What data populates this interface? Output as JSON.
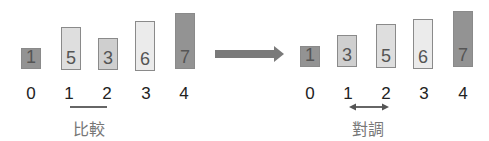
{
  "colors": {
    "dark": "#939393",
    "medium": "#cfcfcf",
    "light": "#dedede",
    "lightest": "#ebebeb",
    "border": "#8a8a8a",
    "arrow": "#7a7a7a",
    "caption": "#777777"
  },
  "before": {
    "bars": [
      {
        "value": "1",
        "index": "0",
        "fill": "#939393"
      },
      {
        "value": "5",
        "index": "1",
        "fill": "#dedede"
      },
      {
        "value": "3",
        "index": "2",
        "fill": "#cfcfcf"
      },
      {
        "value": "6",
        "index": "3",
        "fill": "#ebebeb"
      },
      {
        "value": "7",
        "index": "4",
        "fill": "#939393"
      }
    ],
    "caption": "比較",
    "marker": "line-under-1-2"
  },
  "after": {
    "bars": [
      {
        "value": "1",
        "index": "0",
        "fill": "#939393"
      },
      {
        "value": "3",
        "index": "1",
        "fill": "#cfcfcf"
      },
      {
        "value": "5",
        "index": "2",
        "fill": "#dedede"
      },
      {
        "value": "6",
        "index": "3",
        "fill": "#ebebeb"
      },
      {
        "value": "7",
        "index": "4",
        "fill": "#939393"
      }
    ],
    "caption": "對調",
    "marker": "double-arrow-1-2"
  },
  "transition": "right-arrow"
}
